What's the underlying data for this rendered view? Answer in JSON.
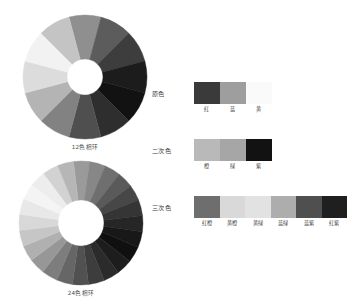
{
  "page": {
    "background": "#ffffff"
  },
  "wheels": [
    {
      "id": "wheel-12",
      "caption": "12色相环",
      "segments": 12,
      "outer_radius": 62,
      "inner_radius": 18,
      "start_angle": -105,
      "colors": [
        "#8f8f8f",
        "#5c5c5c",
        "#3d3d3d",
        "#1c1c1c",
        "#121212",
        "#2e2e2e",
        "#4f4f4f",
        "#828282",
        "#b4b4b4",
        "#dcdcdc",
        "#f2f2f2",
        "#c4c4c4"
      ]
    },
    {
      "id": "wheel-24",
      "caption": "24色相环",
      "segments": 24,
      "outer_radius": 62,
      "inner_radius": 23,
      "start_angle": -97,
      "colors": [
        "#9a9a9a",
        "#878787",
        "#6f6f6f",
        "#5a5a5a",
        "#474747",
        "#353535",
        "#262626",
        "#181818",
        "#101010",
        "#1d1d1d",
        "#2b2b2b",
        "#3d3d3d",
        "#515151",
        "#666666",
        "#7d7d7d",
        "#979797",
        "#b0b0b0",
        "#c6c6c6",
        "#d8d8d8",
        "#e8e8e8",
        "#f4f4f4",
        "#ededed",
        "#d2d2d2",
        "#b6b6b6"
      ]
    }
  ],
  "swatch_rows": [
    {
      "id": "primary",
      "label": "原色",
      "swatches": [
        {
          "name": "红",
          "color": "#3a3a3a"
        },
        {
          "name": "蓝",
          "color": "#9e9e9e"
        },
        {
          "name": "黄",
          "color": "#fafafa"
        }
      ]
    },
    {
      "id": "secondary",
      "label": "二次色",
      "swatches": [
        {
          "name": "橙",
          "color": "#b9b9b9"
        },
        {
          "name": "绿",
          "color": "#a6a6a6"
        },
        {
          "name": "紫",
          "color": "#121212"
        }
      ]
    },
    {
      "id": "tertiary",
      "label": "三次色",
      "swatches": [
        {
          "name": "红橙",
          "color": "#6e6e6e"
        },
        {
          "name": "黄橙",
          "color": "#d9d9d9"
        },
        {
          "name": "黄绿",
          "color": "#e2e2e2"
        },
        {
          "name": "蓝绿",
          "color": "#adadad"
        },
        {
          "name": "蓝紫",
          "color": "#4f4f4f"
        },
        {
          "name": "红紫",
          "color": "#1f1f1f"
        }
      ]
    }
  ]
}
